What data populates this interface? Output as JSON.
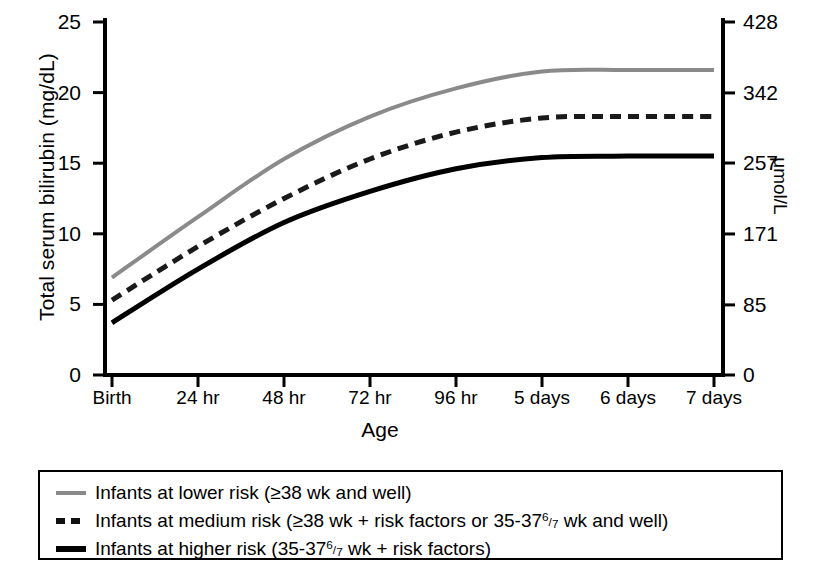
{
  "chart_data": {
    "type": "line",
    "title": "",
    "xlabel": "Age",
    "ylabel": "Total serum bilirubin (mg/dL)",
    "ylabel_right": "μmol/L",
    "grid": false,
    "legend_position": "below",
    "categories": [
      "Birth",
      "24 hr",
      "48 hr",
      "72 hr",
      "96 hr",
      "5 days",
      "6 days",
      "7 days"
    ],
    "x": [
      0,
      1,
      2,
      3,
      4,
      5,
      6,
      7
    ],
    "ylim": [
      0,
      25
    ],
    "yticks": [
      "0",
      "5",
      "10",
      "15",
      "20",
      "25"
    ],
    "ytick_values": [
      0,
      5,
      10,
      15,
      20,
      25
    ],
    "ylim_right": [
      0,
      428
    ],
    "yticks_right": [
      "0",
      "85",
      "171",
      "257",
      "342",
      "428"
    ],
    "ytick_values_right": [
      0,
      85,
      171,
      257,
      342,
      428
    ],
    "series": [
      {
        "name": "Infants at lower risk (≥38 wk and well)",
        "style": "solid",
        "color": "#8a8a8a",
        "width": 4,
        "values": [
          6.9,
          11.2,
          15.3,
          18.3,
          20.3,
          21.5,
          21.6,
          21.6
        ]
      },
      {
        "name": "Infants at medium risk (≥38 wk + risk factors or 35-37 6/7 wk and well)",
        "style": "dashed",
        "color": "#1a1a1a",
        "width": 5,
        "values": [
          5.3,
          9.1,
          12.5,
          15.3,
          17.2,
          18.2,
          18.3,
          18.3
        ]
      },
      {
        "name": "Infants at higher risk (35-37 6/7 wk + risk factors)",
        "style": "solid",
        "color": "#000000",
        "width": 5,
        "values": [
          3.7,
          7.5,
          10.8,
          13.0,
          14.6,
          15.4,
          15.5,
          15.5
        ]
      }
    ]
  },
  "axes": {
    "left_title": "Total serum bilirubin (mg/dL)",
    "right_title": "μmol/L",
    "bottom_title": "Age"
  },
  "legend": {
    "items": [
      {
        "swatch": "lower-risk-grey-solid-line",
        "prefix": "Infants at lower risk (≥38 wk and well)",
        "has_fraction": false,
        "suffix": ""
      },
      {
        "swatch": "medium-risk-black-dashed-line",
        "prefix": "Infants at medium risk (≥38 wk + risk factors or 35-37",
        "has_fraction": true,
        "numerator": "6",
        "denominator": "7",
        "suffix": " wk and well)"
      },
      {
        "swatch": "higher-risk-black-solid-line",
        "prefix": "Infants at higher risk (35-37",
        "has_fraction": true,
        "numerator": "6",
        "denominator": "7",
        "suffix": " wk + risk factors)"
      }
    ]
  }
}
